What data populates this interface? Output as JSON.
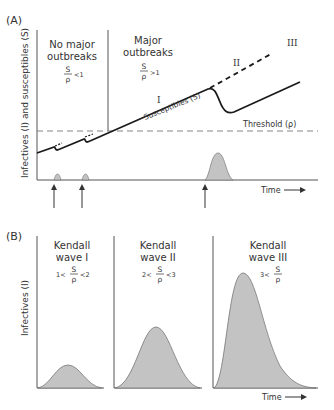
{
  "panel_a": {
    "label": "(A)",
    "y_axis_label": "Infectives (I) and susceptibles (S)",
    "x_axis_label": "Time",
    "regions": [
      {
        "title_line1": "No major",
        "title_line2": "outbreaks",
        "ratio_num": "S",
        "ratio_den": "ρ",
        "ratio_cmp": "<1"
      },
      {
        "title_line1": "Major",
        "title_line2": "outbreaks",
        "ratio_num": "S",
        "ratio_den": "ρ",
        "ratio_cmp": ">1"
      }
    ],
    "threshold_label": "Threshold (ρ)",
    "susceptibles_label": "Susceptibles (S)",
    "wave_markers": [
      "I",
      "II",
      "III"
    ]
  },
  "panel_b": {
    "label": "(B)",
    "y_axis_label": "Infectives (I)",
    "x_axis_label": "Time",
    "waves": [
      {
        "title_line1": "Kendall",
        "title_line2": "wave I",
        "cond_left": "1<",
        "ratio_num": "S",
        "ratio_den": "ρ",
        "cond_right": "<2"
      },
      {
        "title_line1": "Kendall",
        "title_line2": "wave II",
        "cond_left": "2<",
        "ratio_num": "S",
        "ratio_den": "ρ",
        "cond_right": "<3"
      },
      {
        "title_line1": "Kendall",
        "title_line2": "wave III",
        "cond_left": "3<",
        "ratio_num": "S",
        "ratio_den": "ρ",
        "cond_right": ""
      }
    ]
  },
  "colors": {
    "axis": "#555555",
    "curve": "#1a1a1a",
    "fill": "#c8c8c8",
    "fill_stroke": "#777777",
    "threshold": "#777777"
  }
}
